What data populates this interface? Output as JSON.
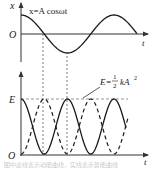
{
  "chart_data": [
    {
      "type": "line",
      "title": "",
      "xlabel": "t",
      "ylabel": "x",
      "origin_label": "O",
      "annotation": "x=A cosωt",
      "x": [
        0,
        0.25,
        0.5,
        0.75,
        1.0,
        1.25,
        1.5,
        1.75,
        2.0
      ],
      "x_unit": "period T (approx, 2 periods shown)",
      "series": [
        {
          "name": "x = A cos ωt",
          "style": "solid",
          "values": [
            1,
            0.71,
            0,
            -0.71,
            -1,
            -0.71,
            0,
            0.71,
            1
          ]
        }
      ],
      "ylim": [
        -1,
        1
      ],
      "grid": false
    },
    {
      "type": "line",
      "title": "",
      "xlabel": "t",
      "ylabel": "E",
      "origin_label": "O",
      "annotation": "E=½kA²",
      "x": [
        0,
        0.25,
        0.5,
        0.75,
        1.0,
        1.25,
        1.5,
        1.75,
        2.0
      ],
      "series": [
        {
          "name": "Potential energy (½kx²)",
          "style": "solid",
          "values": [
            1,
            0.5,
            0,
            0.5,
            1,
            0.5,
            0,
            0.5,
            1
          ]
        },
        {
          "name": "Kinetic energy",
          "style": "dashed",
          "values": [
            0,
            0.5,
            1,
            0.5,
            0,
            0.5,
            1,
            0.5,
            0
          ]
        },
        {
          "name": "Total energy E = ½kA²",
          "style": "dashed-gray",
          "values": [
            1,
            1,
            1,
            1,
            1,
            1,
            1,
            1,
            1
          ]
        }
      ],
      "ylim": [
        0,
        1
      ],
      "grid": false
    }
  ],
  "labels": {
    "top_y": "x",
    "top_origin": "O",
    "top_t": "t",
    "top_formula": "x=A cosωt",
    "bottom_y": "E",
    "bottom_origin": "O",
    "bottom_t": "t",
    "bottom_formula_lhs": "E=",
    "bottom_formula_num": "1",
    "bottom_formula_den": "2",
    "bottom_formula_rhs": "kA",
    "bottom_formula_exp": "2"
  },
  "colors": {
    "curve": "#1a1a1a",
    "axis": "#333333",
    "guide": "#555555",
    "energy_line": "#8a8a8a"
  },
  "caption": "图中虚线表示动能曲线，实线表示势能曲线"
}
